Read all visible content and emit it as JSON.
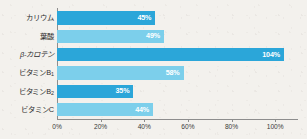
{
  "chart_data": {
    "type": "bar",
    "orientation": "horizontal",
    "title": "",
    "subtitle": "",
    "xlabel": "",
    "ylabel": "",
    "categories": [
      "カリウム",
      "葉酸",
      "β-カロテン",
      "ビタミンB1",
      "ビタミンB2",
      "ビタミンC"
    ],
    "values": [
      45,
      49,
      104,
      58,
      35,
      44
    ],
    "data_labels": [
      "45%",
      "49%",
      "104%",
      "58%",
      "35%",
      "44%"
    ],
    "bar_colors": [
      "#2ba6d9",
      "#7ccfeb",
      "#2ba6d9",
      "#7ccfeb",
      "#2ba6d9",
      "#7ccfeb"
    ],
    "xlim": [
      0,
      110
    ],
    "xtick_values": [
      0,
      20,
      40,
      60,
      80,
      100
    ],
    "xtick_labels": [
      "0%",
      "20%",
      "40%",
      "60%",
      "80%",
      "100%"
    ],
    "grid": false,
    "legend": null,
    "background_color": "#f3f1ed",
    "axis_color": "#8d8d8d"
  },
  "category_labels": [
    {
      "main": "カリウム",
      "sub": "",
      "italic": false
    },
    {
      "main": "葉酸",
      "sub": "",
      "italic": false
    },
    {
      "main": "β-カロテン",
      "sub": "",
      "italic": true
    },
    {
      "main": "ビタミンB",
      "sub": "1",
      "italic": false
    },
    {
      "main": "ビタミンB",
      "sub": "2",
      "italic": false
    },
    {
      "main": "ビタミンC",
      "sub": "",
      "italic": false
    }
  ]
}
